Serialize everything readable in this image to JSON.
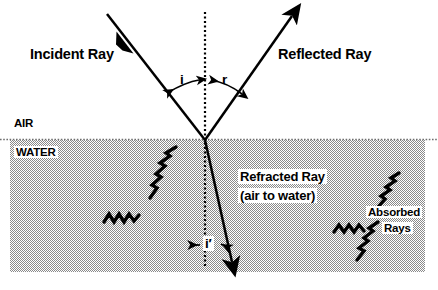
{
  "diagram": {
    "labels": {
      "incident_ray": "Incident Ray",
      "reflected_ray": "Reflected Ray",
      "refracted_ray": "Refracted Ray",
      "refracted_ray_sub": "(air to water)",
      "absorbed_rays_line1": "Absorbed",
      "absorbed_rays_line2": "Rays",
      "medium_upper": "AIR",
      "medium_lower": "WATER",
      "angle_incidence": "i",
      "angle_reflection": "r",
      "angle_refraction": "i′"
    },
    "colors": {
      "ink": "#000000",
      "water_fill": "#b3b3b3",
      "background": "#ffffff"
    },
    "geometry": {
      "interface_y": 140,
      "incidence_point_x": 205,
      "normal_line": "dotted vertical",
      "water_top": 140,
      "water_bottom": 272,
      "water_left": 10,
      "water_right": 425
    }
  }
}
